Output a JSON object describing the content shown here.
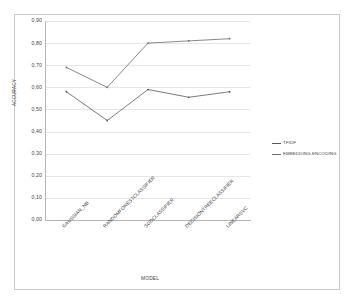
{
  "chart_data": {
    "type": "line",
    "title": "",
    "xlabel": "MODEL",
    "ylabel": "ACCURACY",
    "categories": [
      "GAUSSIAN_NB",
      "RANDOMFORESTCLASSIFIER",
      "SGDCLASSIFIER",
      "DECISIONTREECLASSIFIER",
      "LINEARSVC"
    ],
    "series": [
      {
        "name": "TFIDF",
        "color": "#595959",
        "values": [
          0.58,
          0.45,
          0.59,
          0.555,
          0.58
        ]
      },
      {
        "name": "EMBEDDING-ENCODING",
        "color": "#6b6b6b",
        "values": [
          0.69,
          0.6,
          0.8,
          0.81,
          0.82
        ]
      }
    ],
    "ylim": [
      0.0,
      0.9
    ],
    "ytick_labels": [
      "0,90",
      "0,80",
      "0,70",
      "0,60",
      "0,50",
      "0,40",
      "0,30",
      "0,20",
      "0,10",
      "0,00"
    ],
    "ytick_values": [
      0.9,
      0.8,
      0.7,
      0.6,
      0.5,
      0.4,
      0.3,
      0.2,
      0.1,
      0.0
    ],
    "grid": true,
    "legend_position": "right",
    "marker": "small-dot",
    "background_color": "#ffffff",
    "gridline_color": "#e6e6e6",
    "frame_color": "#c9c9c9"
  }
}
